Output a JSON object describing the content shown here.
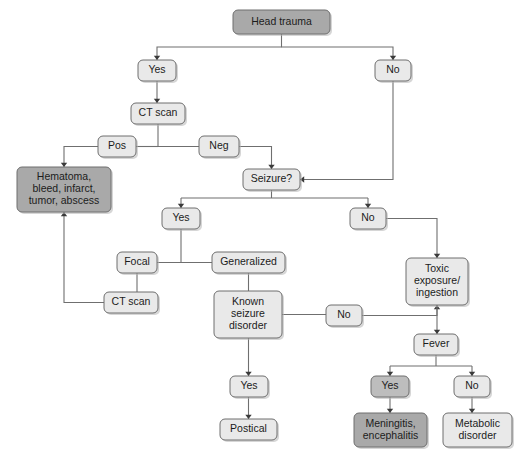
{
  "diagram": {
    "type": "flowchart",
    "canvas": {
      "width": 530,
      "height": 472,
      "background": "#ffffff"
    },
    "palette": {
      "node_dark": "#a9a9a9",
      "node_mid": "#bdbdbd",
      "node_light": "#e9e9e9",
      "node_border": "#6e6e6e",
      "edge": "#6f6f6f",
      "text": "#1c1c1c"
    },
    "nodes": [
      {
        "id": "head_trauma",
        "label": "Head trauma",
        "lines": [
          "Head trauma"
        ],
        "shade": "dark",
        "x": 233,
        "y": 10,
        "w": 97,
        "h": 24
      },
      {
        "id": "yes_1",
        "label": "Yes",
        "lines": [
          "Yes"
        ],
        "shade": "light",
        "x": 138,
        "y": 60,
        "w": 38,
        "h": 21
      },
      {
        "id": "no_1",
        "label": "No",
        "lines": [
          "No"
        ],
        "shade": "light",
        "x": 375,
        "y": 60,
        "w": 36,
        "h": 21
      },
      {
        "id": "ct_scan_1",
        "label": "CT scan",
        "lines": [
          "CT scan"
        ],
        "shade": "light",
        "x": 131,
        "y": 103,
        "w": 54,
        "h": 21
      },
      {
        "id": "pos",
        "label": "Pos",
        "lines": [
          "Pos"
        ],
        "shade": "light",
        "x": 98,
        "y": 136,
        "w": 38,
        "h": 21
      },
      {
        "id": "neg",
        "label": "Neg",
        "lines": [
          "Neg"
        ],
        "shade": "light",
        "x": 199,
        "y": 136,
        "w": 40,
        "h": 21
      },
      {
        "id": "hematoma",
        "label": "Hematoma, bleed, infarct, tumor, abscess",
        "lines": [
          "Hematoma,",
          "bleed, infarct,",
          "tumor, abscess"
        ],
        "shade": "dark",
        "x": 17,
        "y": 167,
        "w": 94,
        "h": 45
      },
      {
        "id": "seizure_q",
        "label": "Seizure?",
        "lines": [
          "Seizure?"
        ],
        "shade": "light",
        "x": 243,
        "y": 169,
        "w": 57,
        "h": 21
      },
      {
        "id": "yes_2",
        "label": "Yes",
        "lines": [
          "Yes"
        ],
        "shade": "light",
        "x": 162,
        "y": 208,
        "w": 38,
        "h": 21
      },
      {
        "id": "no_2",
        "label": "No",
        "lines": [
          "No"
        ],
        "shade": "light",
        "x": 350,
        "y": 208,
        "w": 36,
        "h": 21
      },
      {
        "id": "focal",
        "label": "Focal",
        "lines": [
          "Focal"
        ],
        "shade": "light",
        "x": 117,
        "y": 252,
        "w": 40,
        "h": 21
      },
      {
        "id": "generalized",
        "label": "Generalized",
        "lines": [
          "Generalized"
        ],
        "shade": "light",
        "x": 212,
        "y": 252,
        "w": 73,
        "h": 21
      },
      {
        "id": "ct_scan_2",
        "label": "CT scan",
        "lines": [
          "CT scan"
        ],
        "shade": "light",
        "x": 104,
        "y": 292,
        "w": 54,
        "h": 21
      },
      {
        "id": "known_seizure",
        "label": "Known seizure disorder",
        "lines": [
          "Known",
          "seizure",
          "disorder"
        ],
        "shade": "light",
        "x": 214,
        "y": 291,
        "w": 68,
        "h": 47
      },
      {
        "id": "toxic",
        "label": "Toxic exposure/ ingestion",
        "lines": [
          "Toxic",
          "exposure/",
          "ingestion"
        ],
        "shade": "light",
        "x": 406,
        "y": 258,
        "w": 62,
        "h": 47
      },
      {
        "id": "no_3",
        "label": "No",
        "lines": [
          "No"
        ],
        "shade": "light",
        "x": 326,
        "y": 305,
        "w": 36,
        "h": 21
      },
      {
        "id": "fever",
        "label": "Fever",
        "lines": [
          "Fever"
        ],
        "shade": "light",
        "x": 414,
        "y": 334,
        "w": 44,
        "h": 21
      },
      {
        "id": "yes_3",
        "label": "Yes",
        "lines": [
          "Yes"
        ],
        "shade": "mid",
        "x": 371,
        "y": 376,
        "w": 38,
        "h": 21
      },
      {
        "id": "no_4",
        "label": "No",
        "lines": [
          "No"
        ],
        "shade": "light",
        "x": 454,
        "y": 376,
        "w": 36,
        "h": 21
      },
      {
        "id": "yes_4",
        "label": "Yes",
        "lines": [
          "Yes"
        ],
        "shade": "light",
        "x": 230,
        "y": 376,
        "w": 38,
        "h": 21
      },
      {
        "id": "postical",
        "label": "Postical",
        "lines": [
          "Postical"
        ],
        "shade": "light",
        "x": 220,
        "y": 419,
        "w": 57,
        "h": 21
      },
      {
        "id": "meningitis",
        "label": "Meningitis, encephalitis",
        "lines": [
          "Meningitis,",
          "encephalitis"
        ],
        "shade": "dark",
        "x": 354,
        "y": 413,
        "w": 73,
        "h": 34
      },
      {
        "id": "metabolic",
        "label": "Metabolic disorder",
        "lines": [
          "Metabolic",
          "disorder"
        ],
        "shade": "light",
        "x": 443,
        "y": 413,
        "w": 69,
        "h": 34
      }
    ],
    "edges": [
      {
        "from": "head_trauma",
        "to": "yes_1",
        "label": ""
      },
      {
        "from": "head_trauma",
        "to": "no_1",
        "label": ""
      },
      {
        "from": "yes_1",
        "to": "ct_scan_1",
        "label": ""
      },
      {
        "from": "ct_scan_1",
        "to": "pos",
        "label": ""
      },
      {
        "from": "ct_scan_1",
        "to": "neg",
        "label": ""
      },
      {
        "from": "pos",
        "to": "hematoma",
        "label": ""
      },
      {
        "from": "neg",
        "to": "seizure_q",
        "label": ""
      },
      {
        "from": "no_1",
        "to": "seizure_q",
        "label": ""
      },
      {
        "from": "seizure_q",
        "to": "yes_2",
        "label": ""
      },
      {
        "from": "seizure_q",
        "to": "no_2",
        "label": ""
      },
      {
        "from": "yes_2",
        "to": "focal",
        "label": ""
      },
      {
        "from": "yes_2",
        "to": "generalized",
        "label": ""
      },
      {
        "from": "focal",
        "to": "ct_scan_2",
        "label": ""
      },
      {
        "from": "ct_scan_2",
        "to": "hematoma",
        "label": ""
      },
      {
        "from": "generalized",
        "to": "known_seizure",
        "label": ""
      },
      {
        "from": "known_seizure",
        "to": "no_3",
        "label": ""
      },
      {
        "from": "known_seizure",
        "to": "yes_4",
        "label": ""
      },
      {
        "from": "yes_4",
        "to": "postical",
        "label": ""
      },
      {
        "from": "no_2",
        "to": "toxic",
        "label": ""
      },
      {
        "from": "no_3",
        "to": "toxic",
        "label": ""
      },
      {
        "from": "toxic",
        "to": "fever",
        "label": ""
      },
      {
        "from": "fever",
        "to": "yes_3",
        "label": ""
      },
      {
        "from": "fever",
        "to": "no_4",
        "label": ""
      },
      {
        "from": "yes_3",
        "to": "meningitis",
        "label": ""
      },
      {
        "from": "no_4",
        "to": "metabolic",
        "label": ""
      }
    ]
  }
}
